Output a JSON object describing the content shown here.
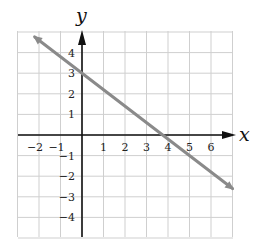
{
  "chart_data": {
    "type": "line",
    "title": "",
    "xlabel": "x",
    "ylabel": "y",
    "xlim": [
      -3,
      7
    ],
    "ylim": [
      -5,
      5
    ],
    "grid": true,
    "x_ticks": [
      -2,
      -1,
      1,
      2,
      3,
      4,
      5,
      6
    ],
    "y_ticks": [
      4,
      3,
      2,
      1,
      -1,
      -2,
      -3,
      -4
    ],
    "x_tick_labels": [
      "−2",
      "−1",
      "1",
      "2",
      "3",
      "4",
      "5",
      "6"
    ],
    "y_tick_labels": [
      "4",
      "3",
      "2",
      "1",
      "−1",
      "−2",
      "−3",
      "−4"
    ],
    "series": [
      {
        "name": "line",
        "equation": "y = -0.8x + 3",
        "slope": -0.8,
        "y_intercept": 3,
        "x_intercept": 3.75,
        "x": [
          -2.2,
          7
        ],
        "y": [
          4.76,
          -2.6
        ],
        "color": "#8a8a8a",
        "arrows": "both"
      }
    ]
  },
  "colors": {
    "grid": "#cfcfcf",
    "axis": "#111111",
    "line": "#8a8a8a"
  }
}
